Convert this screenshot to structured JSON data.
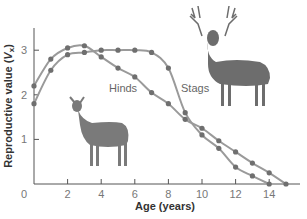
{
  "chart_data": {
    "type": "line",
    "title": "",
    "xlabel": "Age (years)",
    "ylabel": "Reproductive value (Vx)",
    "ylabel_main": "Reproductive value (",
    "ylabel_symbol": "V",
    "ylabel_sub": "x",
    "ylabel_end": ")",
    "xlim": [
      0,
      16
    ],
    "ylim": [
      0,
      3.5
    ],
    "xticks": [
      0,
      2,
      4,
      6,
      8,
      10,
      12,
      14
    ],
    "yticks": [
      1,
      2,
      3
    ],
    "grid": false,
    "legend": "inline labels",
    "series": [
      {
        "name": "Stags",
        "x": [
          0,
          1,
          2,
          3,
          4,
          5,
          6,
          7,
          8,
          9,
          10,
          11,
          12,
          13,
          14
        ],
        "values": [
          1.8,
          2.55,
          2.9,
          2.95,
          3.0,
          3.0,
          3.0,
          2.95,
          2.6,
          1.6,
          1.1,
          0.8,
          0.38,
          0.18,
          0.0
        ]
      },
      {
        "name": "Hinds",
        "x": [
          0,
          1,
          2,
          3,
          4,
          5,
          6,
          7,
          8,
          9,
          10,
          11,
          12,
          13,
          14,
          15
        ],
        "values": [
          2.2,
          2.8,
          3.05,
          3.1,
          2.85,
          2.6,
          2.4,
          2.05,
          1.8,
          1.45,
          1.25,
          0.97,
          0.72,
          0.47,
          0.25,
          0.0
        ]
      }
    ],
    "annotations": [
      "Hinds",
      "Stags",
      "hind illustration",
      "stag illustration"
    ]
  },
  "colors": {
    "line": "#9a9a9a",
    "marker": "#6f6f6f",
    "axis": "#555555",
    "background": "#ffffff"
  }
}
